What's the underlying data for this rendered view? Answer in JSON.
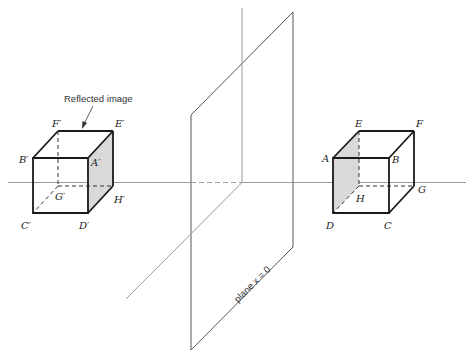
{
  "diagram": {
    "annotation": "Reflected image",
    "plane_label": "plane x = 0",
    "colors": {
      "edge": "#1a1a1a",
      "axis": "#9a9a9a",
      "shade": "#d9d9d9"
    },
    "original_cube": {
      "labels": {
        "A": "A",
        "B": "B",
        "C": "C",
        "D": "D",
        "E": "E",
        "F": "F",
        "G": "G",
        "H": "H"
      }
    },
    "reflected_cube": {
      "labels": {
        "A": "A′",
        "B": "B′",
        "C": "C′",
        "D": "D′",
        "E": "E′",
        "F": "F′",
        "G": "G′",
        "H": "H′"
      }
    }
  }
}
